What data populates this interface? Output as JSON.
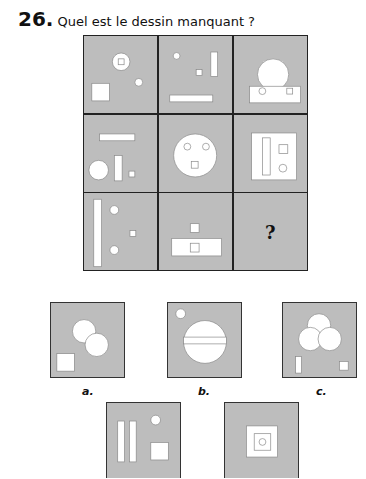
{
  "question": {
    "number": "26.",
    "text": "Quel est le dessin manquant ?"
  },
  "grid": {
    "missing_symbol": "?"
  },
  "options": [
    {
      "label": "a."
    },
    {
      "label": "b."
    },
    {
      "label": "c."
    },
    {
      "label": "d."
    },
    {
      "label": "e."
    }
  ],
  "colors": {
    "cell_bg": "#bdbdbd",
    "shape_fill": "#ffffff",
    "border": "#222222"
  }
}
